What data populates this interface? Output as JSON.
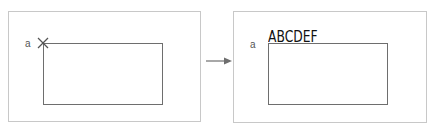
{
  "diagram": {
    "before": {
      "point_label": "a",
      "marker": "cross-marker"
    },
    "after": {
      "point_label": "a",
      "inserted_text": "ABCDEF"
    },
    "transition": "arrow-right",
    "colors": {
      "panel_border": "#c8c8c8",
      "rect_border": "#6e6e6e",
      "arrow": "#6e6e6e",
      "text": "#111111"
    }
  }
}
